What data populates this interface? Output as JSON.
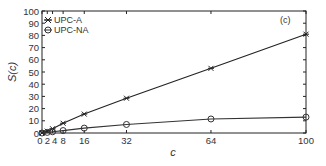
{
  "chart_data": {
    "type": "line",
    "title": "",
    "annotation": "(c)",
    "xlabel": "c",
    "ylabel": "S(c)",
    "xlim": [
      0,
      100
    ],
    "ylim": [
      0,
      100
    ],
    "xticks": [
      0,
      2,
      4,
      8,
      16,
      32,
      64,
      100
    ],
    "xtick_labels": [
      "0",
      "2",
      "4",
      "8",
      "16",
      "32",
      "64",
      "100"
    ],
    "yticks": [
      0,
      10,
      20,
      30,
      40,
      50,
      60,
      70,
      80,
      90,
      100
    ],
    "grid": false,
    "legend_position": "upper left",
    "x": [
      0,
      2,
      4,
      8,
      16,
      32,
      64,
      100
    ],
    "series": [
      {
        "name": "UPC-A",
        "marker": "asterisk",
        "color": "#222222",
        "values": [
          0,
          1.5,
          3.5,
          8,
          15.5,
          28.5,
          53,
          81
        ]
      },
      {
        "name": "UPC-NA",
        "marker": "circle",
        "color": "#333333",
        "values": [
          0,
          0.5,
          1,
          2,
          4,
          7,
          11.5,
          13
        ]
      }
    ]
  },
  "legend": {
    "items": [
      "UPC-A",
      "UPC-NA"
    ]
  },
  "axes": {
    "xlabel": "c",
    "ylabel": "S(c)",
    "annotation": "(c)"
  }
}
